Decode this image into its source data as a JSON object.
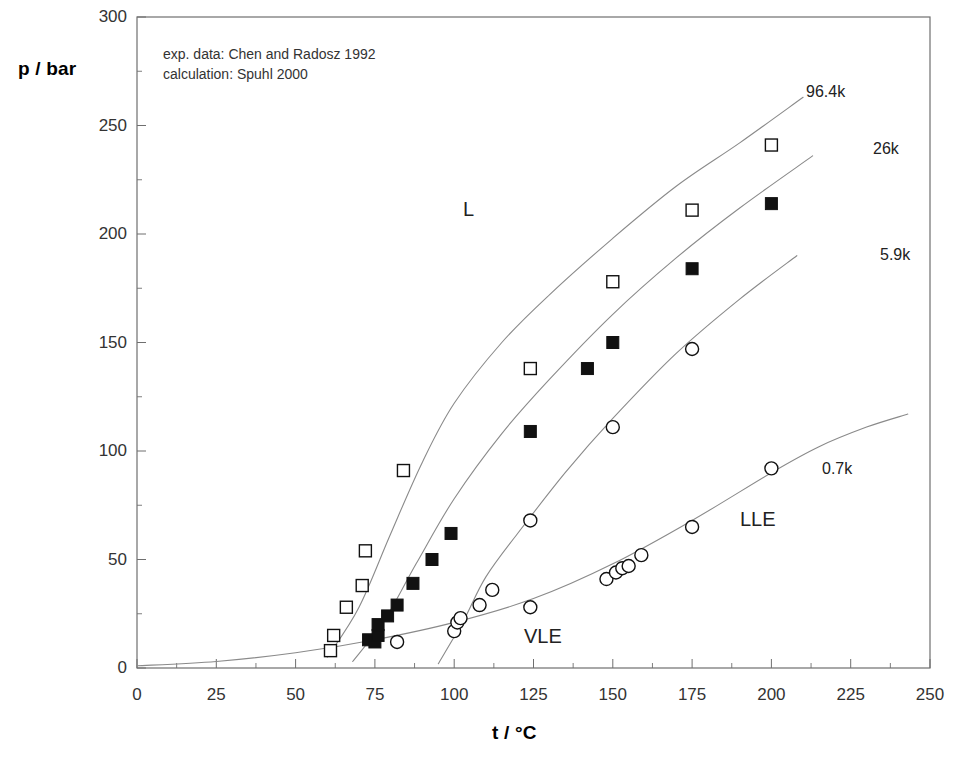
{
  "chart_data": {
    "type": "scatter",
    "title": "",
    "xlabel": "t / °C",
    "ylabel": "p / bar",
    "xlim": [
      0,
      250
    ],
    "ylim": [
      0,
      300
    ],
    "xticks": [
      0,
      25,
      50,
      75,
      100,
      125,
      150,
      175,
      200,
      225,
      250
    ],
    "yticks": [
      0,
      50,
      100,
      150,
      200,
      250,
      300
    ],
    "grid": false,
    "legend": "none",
    "annotations": [
      "exp. data: Chen and Radosz 1992",
      "calculation: Spuhl 2000"
    ],
    "region_labels": [
      {
        "text": "L",
        "x": 107,
        "y": 212
      },
      {
        "text": "LLE",
        "x": 196,
        "y": 63
      },
      {
        "text": "VLE",
        "x": 127,
        "y": 14
      }
    ],
    "curve_labels": [
      {
        "text": "96.4k",
        "x": 217,
        "y": 265
      },
      {
        "text": "26k",
        "x": 243,
        "y": 243
      },
      {
        "text": "5.9k",
        "x": 245,
        "y": 193
      },
      {
        "text": "0.7k",
        "x": 215,
        "y": 101
      }
    ],
    "series": [
      {
        "name": "96.4k",
        "marker": "open-square",
        "points": [
          [
            61,
            8
          ],
          [
            62,
            15
          ],
          [
            66,
            28
          ],
          [
            71,
            38
          ],
          [
            72,
            54
          ],
          [
            84,
            91
          ],
          [
            124,
            138
          ],
          [
            150,
            178
          ],
          [
            175,
            211
          ],
          [
            200,
            241
          ]
        ]
      },
      {
        "name": "26k",
        "marker": "filled-square",
        "points": [
          [
            73,
            13
          ],
          [
            75,
            12
          ],
          [
            76,
            15
          ],
          [
            76,
            20
          ],
          [
            79,
            24
          ],
          [
            82,
            29
          ],
          [
            87,
            39
          ],
          [
            93,
            50
          ],
          [
            99,
            62
          ],
          [
            124,
            109
          ],
          [
            142,
            138
          ],
          [
            150,
            150
          ],
          [
            175,
            184
          ],
          [
            200,
            214
          ]
        ]
      },
      {
        "name": "5.9k and 0.7k",
        "marker": "open-circle",
        "points": [
          [
            82,
            12
          ],
          [
            100,
            17
          ],
          [
            101,
            21
          ],
          [
            102,
            23
          ],
          [
            108,
            29
          ],
          [
            112,
            36
          ],
          [
            124,
            68
          ],
          [
            150,
            111
          ],
          [
            175,
            147
          ],
          [
            124,
            28
          ],
          [
            148,
            41
          ],
          [
            151,
            44
          ],
          [
            153,
            46
          ],
          [
            155,
            47
          ],
          [
            159,
            52
          ],
          [
            175,
            65
          ],
          [
            200,
            92
          ]
        ]
      }
    ],
    "curves": [
      {
        "name": "96.4k-curve",
        "points": [
          [
            60,
            5
          ],
          [
            70,
            28
          ],
          [
            80,
            62
          ],
          [
            90,
            95
          ],
          [
            100,
            122
          ],
          [
            115,
            150
          ],
          [
            130,
            172
          ],
          [
            150,
            198
          ],
          [
            170,
            222
          ],
          [
            190,
            242
          ],
          [
            210,
            263
          ]
        ]
      },
      {
        "name": "26k-curve",
        "points": [
          [
            68,
            3
          ],
          [
            78,
            22
          ],
          [
            88,
            48
          ],
          [
            100,
            78
          ],
          [
            115,
            108
          ],
          [
            130,
            133
          ],
          [
            150,
            163
          ],
          [
            170,
            189
          ],
          [
            190,
            212
          ],
          [
            213,
            236
          ]
        ]
      },
      {
        "name": "5.9k-curve",
        "points": [
          [
            95,
            2
          ],
          [
            103,
            22
          ],
          [
            110,
            42
          ],
          [
            120,
            62
          ],
          [
            135,
            90
          ],
          [
            150,
            115
          ],
          [
            170,
            145
          ],
          [
            190,
            170
          ],
          [
            208,
            190
          ]
        ]
      },
      {
        "name": "0.7k-curve",
        "points": [
          [
            0,
            1
          ],
          [
            25,
            3
          ],
          [
            50,
            7
          ],
          [
            75,
            13
          ],
          [
            100,
            21
          ],
          [
            125,
            32
          ],
          [
            150,
            48
          ],
          [
            175,
            68
          ],
          [
            200,
            90
          ],
          [
            215,
            102
          ],
          [
            230,
            111
          ],
          [
            243,
            117
          ]
        ]
      }
    ]
  },
  "notes": {
    "line1": "exp. data: Chen and Radosz 1992",
    "line2": "calculation: Spuhl 2000"
  },
  "axes": {
    "ylabel": "p / bar",
    "xlabel": "t / °C",
    "ytick_labels": [
      "0",
      "50",
      "100",
      "150",
      "200",
      "250",
      "300"
    ],
    "xtick_labels": [
      "0",
      "25",
      "50",
      "75",
      "100",
      "125",
      "150",
      "175",
      "200",
      "225",
      "250"
    ]
  },
  "labels": {
    "c1": "96.4k",
    "c2": "26k",
    "c3": "5.9k",
    "c4": "0.7k",
    "r1": "L",
    "r2": "LLE",
    "r3": "VLE"
  },
  "colors": {
    "axis": "#6f6f6f",
    "curve": "#8a8a8a",
    "marker": "#111111",
    "text": "#2b2b2b"
  }
}
